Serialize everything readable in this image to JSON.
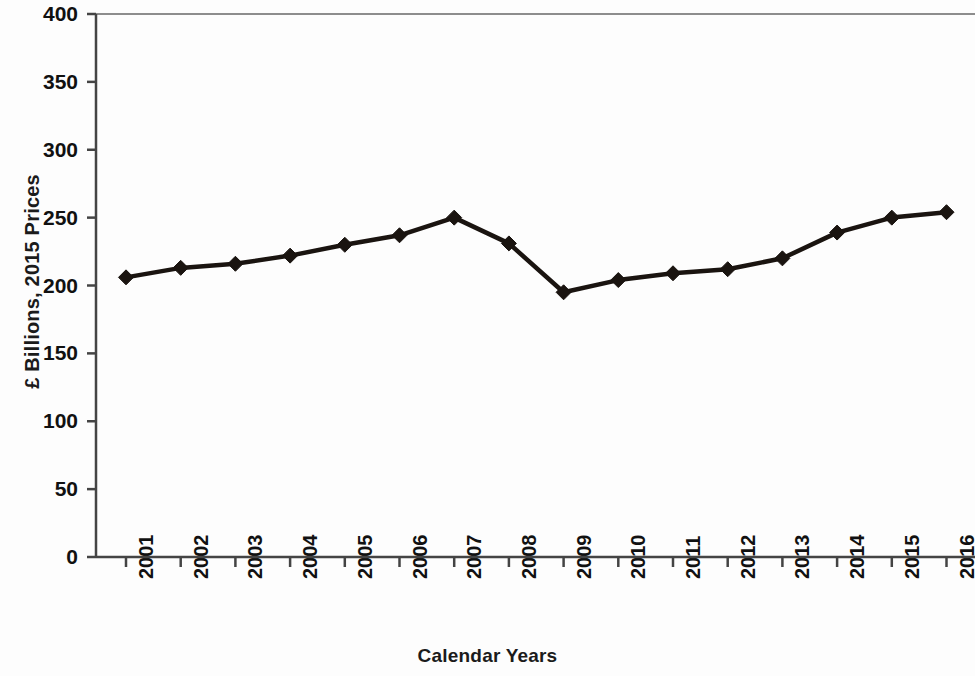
{
  "chart_data": {
    "type": "line",
    "title": "",
    "xlabel": "Calendar Years",
    "ylabel": "£ Billions, 2015 Prices",
    "categories": [
      "2001",
      "2002",
      "2003",
      "2004",
      "2005",
      "2006",
      "2007",
      "2008",
      "2009",
      "2010",
      "2011",
      "2012",
      "2013",
      "2014",
      "2015",
      "2016"
    ],
    "values": [
      206,
      213,
      216,
      222,
      230,
      237,
      250,
      231,
      195,
      204,
      209,
      212,
      220,
      239,
      250,
      254
    ],
    "series": [
      {
        "name": "£ Billions, 2015 Prices",
        "values": [
          206,
          213,
          216,
          222,
          230,
          237,
          250,
          231,
          195,
          204,
          209,
          212,
          220,
          239,
          250,
          254
        ]
      }
    ],
    "ylim": [
      0,
      400
    ],
    "ytick_labels": [
      "400",
      "350",
      "300",
      "250",
      "200",
      "150",
      "100",
      "50",
      "0"
    ],
    "ytick_values": [
      400,
      350,
      300,
      250,
      200,
      150,
      100,
      50,
      0
    ],
    "ytick_step": 50,
    "grid": false,
    "legend": "none",
    "marker": "diamond",
    "line_color": "#1a1410",
    "marker_color": "#1a1410",
    "axis_color": "#444444",
    "background_color": "#fdfdfd"
  }
}
